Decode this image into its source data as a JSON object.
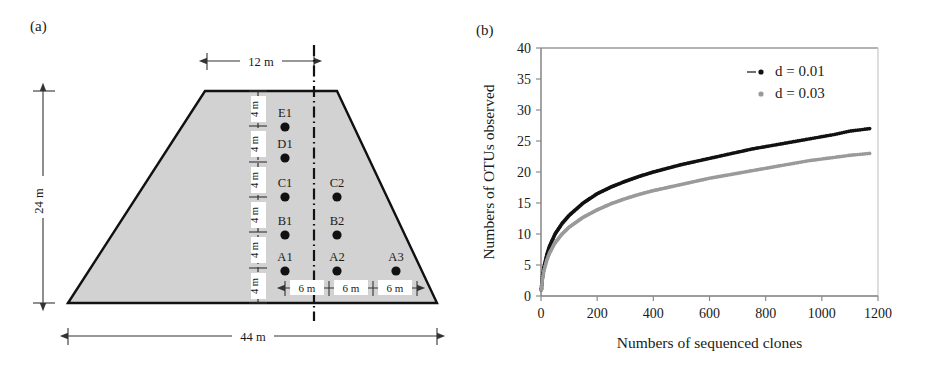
{
  "figure": {
    "panel_a_label": "(a)",
    "panel_b_label": "(b)"
  },
  "diagram": {
    "shape": "trapezoid",
    "dimensions": {
      "top_half_width": "12 m",
      "total_height": "24 m",
      "bottom_width": "44 m",
      "vertical_segment": "4 m",
      "horizontal_segment": "6 m"
    },
    "vertical_segments": [
      "4 m",
      "4 m",
      "4 m",
      "4 m",
      "4 m",
      "4 m"
    ],
    "horizontal_segments": [
      "6 m",
      "6 m",
      "6 m"
    ],
    "sample_points": [
      {
        "label": "E1",
        "col": 1,
        "row": 5
      },
      {
        "label": "D1",
        "col": 1,
        "row": 4
      },
      {
        "label": "C1",
        "col": 1,
        "row": 3
      },
      {
        "label": "B1",
        "col": 1,
        "row": 2
      },
      {
        "label": "A1",
        "col": 1,
        "row": 1
      },
      {
        "label": "C2",
        "col": 2,
        "row": 3
      },
      {
        "label": "B2",
        "col": 2,
        "row": 2
      },
      {
        "label": "A2",
        "col": 2,
        "row": 1
      },
      {
        "label": "A3",
        "col": 3,
        "row": 1
      }
    ],
    "fill_color": "#d0d0d0",
    "outline_color": "#000000"
  },
  "chart_data": {
    "type": "line",
    "title": "",
    "xlabel": "Numbers of sequenced clones",
    "ylabel": "Numbers of OTUs observed",
    "xlim": [
      0,
      1200
    ],
    "ylim": [
      0,
      40
    ],
    "xticks": [
      0,
      200,
      400,
      600,
      800,
      1000,
      1200
    ],
    "yticks": [
      0,
      5,
      10,
      15,
      20,
      25,
      30,
      35,
      40
    ],
    "xtick_labels": [
      "0",
      "200",
      "400",
      "600",
      "800",
      "1000",
      "1200"
    ],
    "ytick_labels": [
      "0",
      "5",
      "10",
      "15",
      "20",
      "25",
      "30",
      "35",
      "40"
    ],
    "grid": false,
    "legend_position": "top-right",
    "series": [
      {
        "name": "d = 0.01",
        "color": "#111111",
        "marker": "dot",
        "x": [
          1,
          5,
          10,
          20,
          30,
          50,
          75,
          100,
          150,
          200,
          250,
          300,
          350,
          400,
          450,
          500,
          550,
          600,
          650,
          700,
          750,
          800,
          850,
          900,
          950,
          1000,
          1050,
          1100,
          1170
        ],
        "y": [
          1.0,
          3.0,
          4.6,
          6.6,
          8.0,
          10.0,
          11.7,
          13.0,
          15.0,
          16.5,
          17.6,
          18.5,
          19.3,
          20.0,
          20.6,
          21.2,
          21.7,
          22.2,
          22.7,
          23.2,
          23.7,
          24.1,
          24.5,
          24.9,
          25.3,
          25.7,
          26.1,
          26.6,
          27.0
        ]
      },
      {
        "name": "d = 0.03",
        "color": "#9a9a9a",
        "marker": "dot",
        "x": [
          1,
          5,
          10,
          20,
          30,
          50,
          75,
          100,
          150,
          200,
          250,
          300,
          350,
          400,
          450,
          500,
          550,
          600,
          650,
          700,
          750,
          800,
          850,
          900,
          950,
          1000,
          1050,
          1100,
          1170
        ],
        "y": [
          1.0,
          2.6,
          4.0,
          5.7,
          6.9,
          8.6,
          10.0,
          11.1,
          12.7,
          13.9,
          14.9,
          15.7,
          16.4,
          17.0,
          17.5,
          18.0,
          18.5,
          19.0,
          19.4,
          19.8,
          20.2,
          20.6,
          21.0,
          21.4,
          21.8,
          22.1,
          22.4,
          22.7,
          23.0
        ]
      }
    ],
    "legend": [
      {
        "label": "d = 0.01",
        "color": "#111111"
      },
      {
        "label": "d = 0.03",
        "color": "#9a9a9a"
      }
    ]
  }
}
